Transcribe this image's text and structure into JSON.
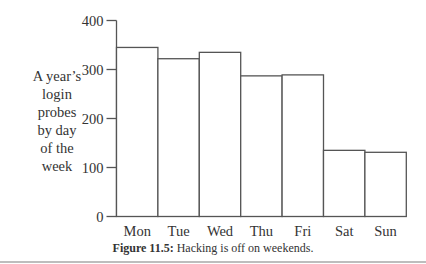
{
  "chart_data": {
    "type": "bar",
    "title": "",
    "xlabel": "",
    "ylabel": "A year's login probes by day of the week",
    "ylabel_lines": [
      "A year’s",
      "login",
      "probes",
      "by day",
      "of the",
      "week"
    ],
    "categories": [
      "Mon",
      "Tue",
      "Wed",
      "Thu",
      "Fri",
      "Sat",
      "Sun"
    ],
    "values": [
      345,
      322,
      335,
      287,
      289,
      135,
      131
    ],
    "yticks": [
      0,
      100,
      200,
      300,
      400
    ],
    "ylim": [
      0,
      400
    ],
    "grid": false,
    "legend": null,
    "bar_fill": "#ffffff",
    "bar_stroke": "#555555"
  },
  "caption": {
    "label": "Figure 11.5:",
    "text": "Hacking is off on weekends."
  }
}
